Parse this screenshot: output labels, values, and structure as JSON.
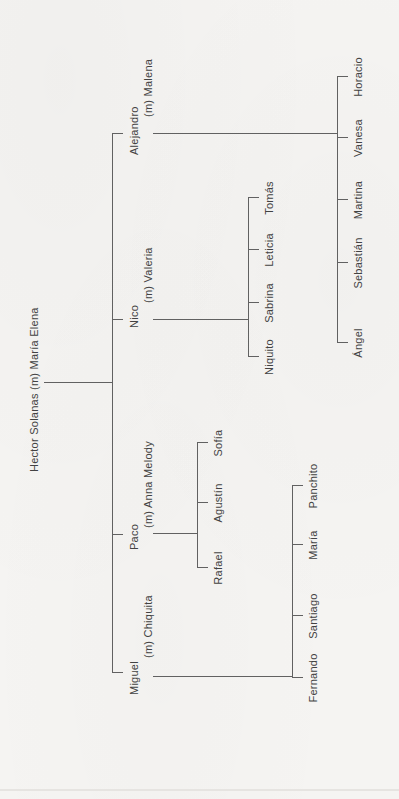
{
  "figure": {
    "kind": "family-tree",
    "orientation": "rotated 90deg counter-clockwise (text reads bottom to top)",
    "colors": {
      "background": "#f5f4f2",
      "line": "#616161",
      "text": "#424242"
    },
    "marriage_notation": "(m)"
  },
  "tree": {
    "root_label": "Hector Solanas (m) María Elena",
    "families": [
      {
        "name": "Miguel",
        "spouse_label": "(m) Chiquita",
        "children": [
          "Fernando",
          "Santiago",
          "María",
          "Panchito"
        ]
      },
      {
        "name": "Paco",
        "spouse_label": "(m) Anna Melody",
        "children": [
          "Rafael",
          "Agustín",
          "Sofía"
        ]
      },
      {
        "name": "Nico",
        "spouse_label": "(m) Valeria",
        "children": [
          "Niquito",
          "Sabrina",
          "Leticia",
          "Tomás"
        ]
      },
      {
        "name": "Alejandro",
        "spouse_label": "(m) Malena",
        "children": [
          "Ángel",
          "Sebastián",
          "Martina",
          "Vanesa",
          "Horacio"
        ]
      }
    ]
  }
}
